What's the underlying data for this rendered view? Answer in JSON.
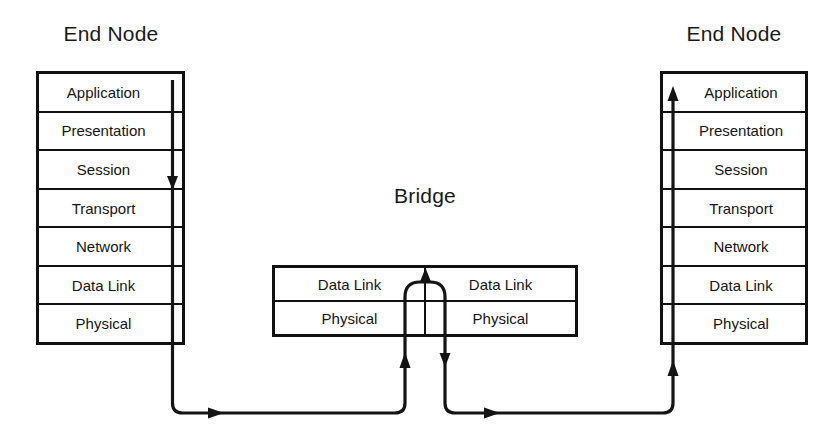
{
  "diagram": {
    "type": "network-layer-bridge-diagram",
    "left_node": {
      "title": "End Node",
      "layers": [
        "Application",
        "Presentation",
        "Session",
        "Transport",
        "Network",
        "Data Link",
        "Physical"
      ]
    },
    "right_node": {
      "title": "End Node",
      "layers": [
        "Application",
        "Presentation",
        "Session",
        "Transport",
        "Network",
        "Data Link",
        "Physical"
      ]
    },
    "bridge": {
      "title": "Bridge",
      "left_port": {
        "layers": [
          "Data Link",
          "Physical"
        ]
      },
      "right_port": {
        "layers": [
          "Data Link",
          "Physical"
        ]
      }
    },
    "flow": {
      "description": "Data descends the left end node stack, traverses the physical medium to the bridge left port, rises to the bridge Data Link layer, crosses to the bridge right port, descends to Physical, traverses the medium to the right end node, and ascends to Application.",
      "colors": {
        "line": "#141414",
        "box_border": "#111111",
        "background": "#ffffff"
      }
    }
  }
}
